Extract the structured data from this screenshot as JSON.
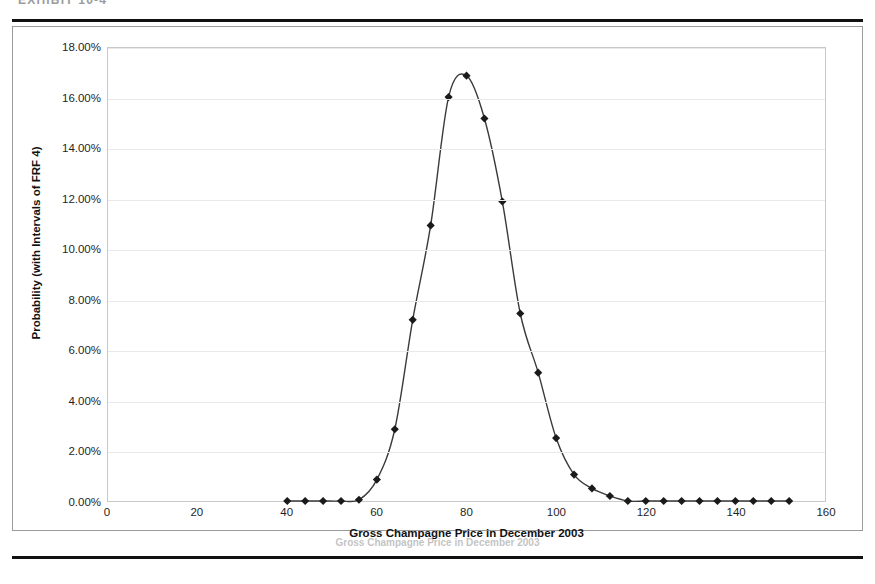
{
  "page": {
    "header_text": "EXHIBIT 10-4",
    "caption": "Gross Champagne Price in December 2003"
  },
  "chart_data": {
    "type": "line",
    "title": "",
    "xlabel": "Gross Champagne Price in December 2003",
    "ylabel": "Probability (with Intervals of FRF 4)",
    "xlim": [
      0,
      160
    ],
    "ylim": [
      0,
      0.18
    ],
    "xticks": [
      0,
      20,
      40,
      60,
      80,
      100,
      120,
      140,
      160
    ],
    "xticklabels": [
      "0",
      "20",
      "40",
      "60",
      "80",
      "100",
      "120",
      "140",
      "160"
    ],
    "yticks": [
      0,
      0.02,
      0.04,
      0.06,
      0.08,
      0.1,
      0.12,
      0.14,
      0.16,
      0.18
    ],
    "yticklabels": [
      "0.00%",
      "2.00%",
      "4.00%",
      "6.00%",
      "8.00%",
      "10.00%",
      "12.00%",
      "14.00%",
      "16.00%",
      "18.00%"
    ],
    "grid": true,
    "legend": false,
    "marker": "diamond",
    "marker_color": "#1a1a1a",
    "line_color": "#3a3a3a",
    "interval": 4,
    "x": [
      40,
      44,
      48,
      52,
      56,
      60,
      64,
      68,
      72,
      76,
      80,
      84,
      88,
      92,
      96,
      100,
      104,
      108,
      112,
      116,
      120,
      124,
      128,
      132,
      136,
      140,
      144,
      148,
      152
    ],
    "values": [
      0.0,
      0.0,
      0.0,
      0.0,
      0.0005,
      0.0085,
      0.0285,
      0.072,
      0.1095,
      0.1605,
      0.169,
      0.152,
      0.119,
      0.0745,
      0.051,
      0.025,
      0.0105,
      0.005,
      0.002,
      0.0,
      0.0,
      0.0,
      0.0,
      0.0,
      0.0,
      0.0,
      0.0,
      0.0,
      0.0
    ],
    "point_labels": [
      "0.00%",
      "0.00%",
      "0.00%",
      "0.00%",
      "0.05%",
      "0.85%",
      "2.85%",
      "7.20%",
      "10.95%",
      "16.05%",
      "16.90%",
      "15.20%",
      "11.90%",
      "7.45%",
      "5.10%",
      "2.50%",
      "1.05%",
      "0.50%",
      "0.20%",
      "0.00%",
      "0.00%",
      "0.00%",
      "0.00%",
      "0.00%",
      "0.00%",
      "0.00%",
      "0.00%",
      "0.00%",
      "0.00%"
    ]
  }
}
